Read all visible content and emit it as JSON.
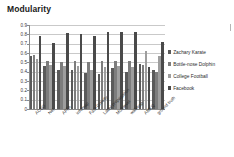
{
  "chart_data": {
    "type": "bar",
    "title": "Modularity",
    "xlabel": "",
    "ylabel": "",
    "ylim": [
      0,
      0.9
    ],
    "ytick_labels": [
      "0.9",
      "0.8",
      "0.7",
      "0.6",
      "0.5",
      "0.4",
      "0.3",
      "0.2",
      "0.1",
      "0"
    ],
    "ytick_values": [
      0.9,
      0.8,
      0.7,
      0.6,
      0.5,
      0.4,
      0.3,
      0.2,
      0.1,
      0
    ],
    "grid": true,
    "legend_position": "right",
    "categories": [
      "ACSO",
      "Net",
      "AFFA",
      "infomap",
      "Fast-Greedy",
      "Label propagation",
      "Multilevel",
      "walktrap",
      "AMKQ",
      "ground truth"
    ],
    "series": [
      {
        "name": "Zachary Karate",
        "color": "#5a5a5a",
        "values": [
          0.57,
          0.46,
          0.42,
          0.42,
          0.39,
          0.37,
          0.44,
          0.4,
          0.48,
          0.42
        ]
      },
      {
        "name": "Bottle-nose Dolphin",
        "color": "#7d7d7d",
        "values": [
          0.58,
          0.51,
          0.5,
          0.51,
          0.5,
          0.51,
          0.51,
          0.51,
          0.47,
          0.4
        ]
      },
      {
        "name": "College Football",
        "color": "#9e9e9e",
        "values": [
          0.54,
          0.47,
          0.46,
          0.46,
          0.42,
          0.45,
          0.46,
          0.45,
          0.62,
          0.57
        ]
      },
      {
        "name": "Facebook",
        "color": "#4a4a4a",
        "values": [
          0.78,
          0.71,
          0.81,
          0.8,
          0.78,
          0.82,
          0.83,
          0.82,
          0.45,
          0.72
        ]
      }
    ]
  }
}
